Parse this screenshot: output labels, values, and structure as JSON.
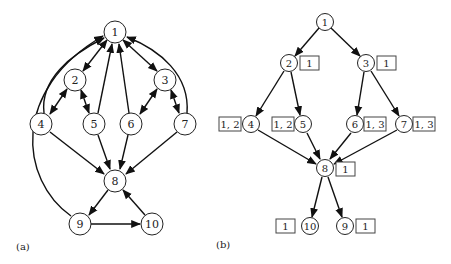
{
  "panel_a": {
    "label": "(a)",
    "nodes": [
      {
        "id": "1",
        "x": 115,
        "y": 32
      },
      {
        "id": "2",
        "x": 75,
        "y": 80
      },
      {
        "id": "3",
        "x": 165,
        "y": 80
      },
      {
        "id": "4",
        "x": 41,
        "y": 124
      },
      {
        "id": "5",
        "x": 94,
        "y": 124
      },
      {
        "id": "6",
        "x": 131,
        "y": 124
      },
      {
        "id": "7",
        "x": 185,
        "y": 124
      },
      {
        "id": "8",
        "x": 115,
        "y": 181
      },
      {
        "id": "9",
        "x": 80,
        "y": 224
      },
      {
        "id": "10",
        "x": 152,
        "y": 224
      }
    ],
    "edges": [
      {
        "from": "1",
        "to": "2",
        "bidirectional": true
      },
      {
        "from": "1",
        "to": "3",
        "bidirectional": true
      },
      {
        "from": "2",
        "to": "4",
        "bidirectional": true
      },
      {
        "from": "2",
        "to": "5",
        "bidirectional": true
      },
      {
        "from": "3",
        "to": "6",
        "bidirectional": true
      },
      {
        "from": "3",
        "to": "7",
        "bidirectional": true
      },
      {
        "from": "4",
        "to": "1"
      },
      {
        "from": "5",
        "to": "1"
      },
      {
        "from": "6",
        "to": "1"
      },
      {
        "from": "7",
        "to": "1"
      },
      {
        "from": "9",
        "to": "1"
      },
      {
        "from": "4",
        "to": "8"
      },
      {
        "from": "5",
        "to": "8"
      },
      {
        "from": "6",
        "to": "8"
      },
      {
        "from": "7",
        "to": "8"
      },
      {
        "from": "8",
        "to": "9"
      },
      {
        "from": "9",
        "to": "10"
      },
      {
        "from": "10",
        "to": "8"
      }
    ]
  },
  "panel_b": {
    "label": "(b)",
    "nodes": [
      {
        "id": "1",
        "x": 325,
        "y": 22,
        "tag": null
      },
      {
        "id": "2",
        "x": 289,
        "y": 63,
        "tag": "1",
        "tag_side": "right"
      },
      {
        "id": "3",
        "x": 366,
        "y": 63,
        "tag": "1",
        "tag_side": "right"
      },
      {
        "id": "4",
        "x": 251,
        "y": 124,
        "tag": "1, 2",
        "tag_side": "left"
      },
      {
        "id": "5",
        "x": 303,
        "y": 124,
        "tag": "1, 2",
        "tag_side": "left"
      },
      {
        "id": "6",
        "x": 355,
        "y": 124,
        "tag": "1, 3",
        "tag_side": "right"
      },
      {
        "id": "7",
        "x": 404,
        "y": 124,
        "tag": "1, 3",
        "tag_side": "right"
      },
      {
        "id": "8",
        "x": 325,
        "y": 168,
        "tag": "1",
        "tag_side": "right"
      },
      {
        "id": "10",
        "x": 310,
        "y": 226,
        "tag": "1",
        "tag_side": "left"
      },
      {
        "id": "9",
        "x": 345,
        "y": 226,
        "tag": "1",
        "tag_side": "right"
      }
    ],
    "edges": [
      {
        "from": "1",
        "to": "2"
      },
      {
        "from": "1",
        "to": "3"
      },
      {
        "from": "2",
        "to": "4"
      },
      {
        "from": "2",
        "to": "5"
      },
      {
        "from": "3",
        "to": "6"
      },
      {
        "from": "3",
        "to": "7"
      },
      {
        "from": "4",
        "to": "8"
      },
      {
        "from": "5",
        "to": "8"
      },
      {
        "from": "6",
        "to": "8"
      },
      {
        "from": "7",
        "to": "8"
      },
      {
        "from": "8",
        "to": "10"
      },
      {
        "from": "8",
        "to": "9"
      }
    ]
  }
}
